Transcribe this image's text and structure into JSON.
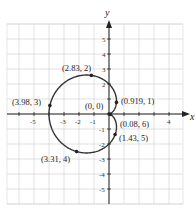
{
  "chart_data": {
    "type": "line",
    "title": "",
    "xlabel": "x",
    "ylabel": "y",
    "xlim": [
      -6,
      5
    ],
    "ylim": [
      -6,
      6
    ],
    "grid": true,
    "x_ticks": [
      -5,
      -3,
      -2,
      -1,
      4
    ],
    "y_ticks": [
      5,
      4,
      3,
      2,
      -1,
      -2,
      -3,
      -4,
      -5
    ],
    "series": [
      {
        "name": "cardioid r = 2 - 2cos(theta)",
        "polar": true
      }
    ],
    "points": [
      {
        "label": "(2.83, 2)",
        "r": 2.83,
        "theta": 2
      },
      {
        "label": "(3.98, 3)",
        "r": 3.98,
        "theta": 3
      },
      {
        "label": "(0, 0)",
        "r": 0,
        "theta": 0
      },
      {
        "label": "(0.919, 1)",
        "r": 0.919,
        "theta": 1
      },
      {
        "label": "(0.08, 6)",
        "r": 0.08,
        "theta": 6
      },
      {
        "label": "(1.43, 5)",
        "r": 1.43,
        "theta": 5
      },
      {
        "label": "(3.31, 4)",
        "r": 3.31,
        "theta": 4
      }
    ]
  },
  "axis_labels": {
    "x": "x",
    "y": "y"
  },
  "labels": {
    "p1": "(2.83, 2)",
    "p2": "(3.98, 3)",
    "p3": "(0, 0)",
    "p4": "(0.919, 1)",
    "p5": "(0.08, 6)",
    "p6": "(1.43, 5)",
    "p7": "(3.31, 4)"
  },
  "ticks": {
    "xm5": "-5",
    "xm3": "-3",
    "xm2": "-2",
    "xm1": "-1",
    "x4": "4",
    "y5": "5",
    "y4": "4",
    "y3": "3",
    "y2": "2",
    "ym1": "-1",
    "ym2": "-2",
    "ym3": "-3",
    "ym4": "-4",
    "ym5": "-5"
  }
}
